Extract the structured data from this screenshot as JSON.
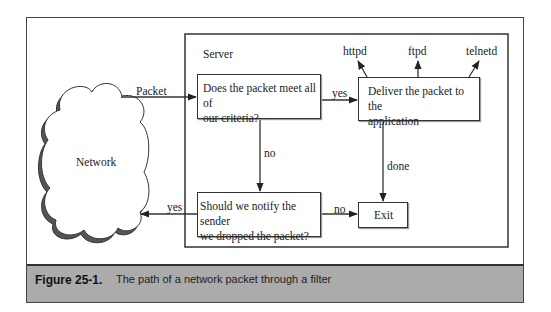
{
  "diagram": {
    "server_label": "Server",
    "network_label": "Network",
    "nodes": {
      "criteria": "Does the packet meet all of our criteria?",
      "criteria_line1": "Does the packet meet all of",
      "criteria_line2": "our criteria?",
      "deliver_line1": "Deliver the packet to the",
      "deliver_line2": "application",
      "notify_line1": "Should we notify the sender",
      "notify_line2": "we dropped the packet?",
      "exit": "Exit"
    },
    "apps": [
      "httpd",
      "ftpd",
      "telnetd"
    ],
    "edges": {
      "packet": "Packet",
      "criteria_yes": "yes",
      "criteria_no": "no",
      "deliver_done": "done",
      "notify_yes": "yes",
      "notify_no": "no"
    },
    "colors": {
      "line": "#333333",
      "caption_band": "#ababab",
      "cloud_shadow": "#555555"
    }
  },
  "caption": {
    "number": "Figure 25-1.",
    "text": "The path of a network packet through a filter"
  }
}
